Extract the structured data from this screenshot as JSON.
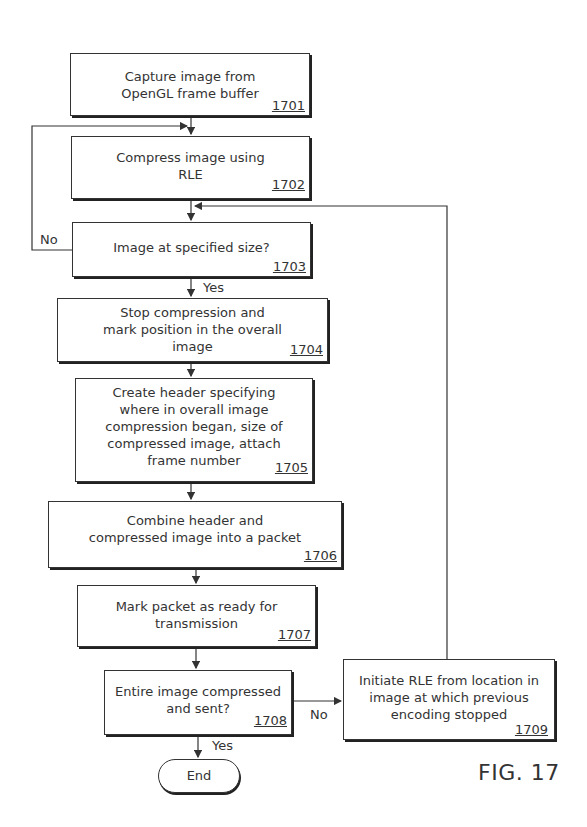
{
  "figure": {
    "label": "FIG. 17"
  },
  "steps": [
    {
      "id": "1701",
      "text": "Capture image from\nOpenGL frame buffer",
      "ref": "1701"
    },
    {
      "id": "1702",
      "text": "Compress image using\nRLE",
      "ref": "1702"
    },
    {
      "id": "1703",
      "text": "Image at specified size?",
      "ref": "1703"
    },
    {
      "id": "1704",
      "text": "Stop compression and\nmark position in the overall\nimage",
      "ref": "1704"
    },
    {
      "id": "1705",
      "text": "Create header specifying\nwhere in overall image\ncompression began, size of\ncompressed image, attach\nframe number",
      "ref": "1705"
    },
    {
      "id": "1706",
      "text": "Combine header and\ncompressed image into a packet",
      "ref": "1706"
    },
    {
      "id": "1707",
      "text": "Mark packet as ready for\ntransmission",
      "ref": "1707"
    },
    {
      "id": "1708",
      "text": "Entire image compressed\nand sent?",
      "ref": "1708"
    },
    {
      "id": "1709",
      "text": "Initiate RLE from location in\nimage at which previous\nencoding stopped",
      "ref": "1709"
    }
  ],
  "terminal": {
    "end_label": "End"
  },
  "edge_labels": {
    "d1703_no": "No",
    "d1703_yes": "Yes",
    "d1708_no": "No",
    "d1708_yes": "Yes"
  }
}
